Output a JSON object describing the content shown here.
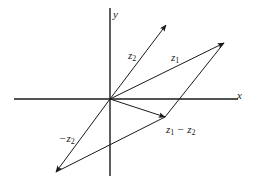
{
  "diagram": {
    "title": "",
    "axes": {
      "x_label": "x",
      "y_label": "y"
    },
    "vectors": [
      {
        "id": "z1",
        "label_base": "z",
        "label_sub": "1",
        "prefix": "",
        "suffix": ""
      },
      {
        "id": "z2",
        "label_base": "z",
        "label_sub": "2",
        "prefix": "",
        "suffix": ""
      },
      {
        "id": "neg-z2",
        "label_base": "z",
        "label_sub": "2",
        "prefix": "−",
        "suffix": ""
      },
      {
        "id": "z1-minus-z2",
        "label_base": "z",
        "label_sub": "1",
        "prefix": "",
        "suffix": " − z",
        "suffix_sub": "2"
      }
    ],
    "colors": {
      "stroke": "#1a1a1a",
      "background": "#ffffff"
    }
  }
}
